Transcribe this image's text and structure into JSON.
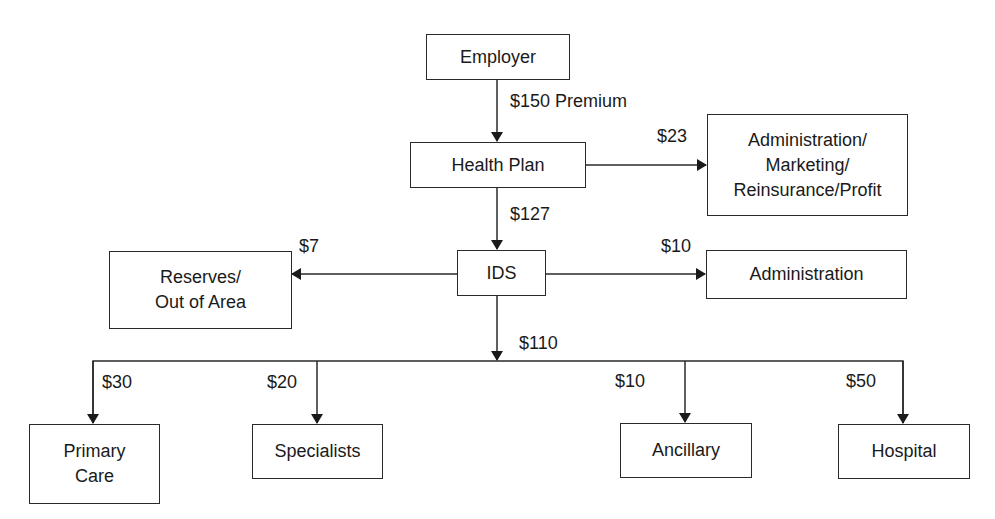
{
  "diagram": {
    "type": "flowchart",
    "title": "",
    "nodes": {
      "employer": {
        "label": "Employer"
      },
      "health_plan": {
        "label": "Health Plan"
      },
      "admin_marketing": {
        "label": "Administration/\nMarketing/\nReinsurance/Profit"
      },
      "ids": {
        "label": "IDS"
      },
      "administration": {
        "label": "Administration"
      },
      "reserves": {
        "label": "Reserves/\nOut of Area"
      },
      "primary_care": {
        "label": "Primary\nCare"
      },
      "specialists": {
        "label": "Specialists"
      },
      "ancillary": {
        "label": "Ancillary"
      },
      "hospital": {
        "label": "Hospital"
      }
    },
    "edges": {
      "employer_to_health_plan": {
        "from": "Employer",
        "to": "Health Plan",
        "label": "$150 Premium"
      },
      "health_plan_to_admin_marketing": {
        "from": "Health Plan",
        "to": "Administration/Marketing/Reinsurance/Profit",
        "label": "$23"
      },
      "health_plan_to_ids": {
        "from": "Health Plan",
        "to": "IDS",
        "label": "$127"
      },
      "ids_to_reserves": {
        "from": "IDS",
        "to": "Reserves/Out of Area",
        "label": "$7"
      },
      "ids_to_administration": {
        "from": "IDS",
        "to": "Administration",
        "label": "$10"
      },
      "ids_to_providers": {
        "from": "IDS",
        "to": "Providers",
        "label": "$110"
      },
      "to_primary_care": {
        "from": "IDS",
        "to": "Primary Care",
        "label": "$30"
      },
      "to_specialists": {
        "from": "IDS",
        "to": "Specialists",
        "label": "$20"
      },
      "to_ancillary": {
        "from": "IDS",
        "to": "Ancillary",
        "label": "$10"
      },
      "to_hospital": {
        "from": "IDS",
        "to": "Hospital",
        "label": "$50"
      }
    }
  },
  "colors": {
    "line": "#2a2a2a",
    "text": "#1a1a1a",
    "background": "#ffffff"
  }
}
